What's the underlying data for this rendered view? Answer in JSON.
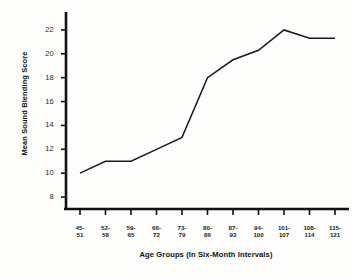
{
  "chart_data": {
    "type": "line",
    "title": "",
    "xlabel": "Age Groups (In Six-Month Intervals)",
    "ylabel": "Mean Sound Blending Score",
    "categories": [
      "45-51",
      "52-58",
      "59-65",
      "66-72",
      "73-79",
      "80-86",
      "87-93",
      "94-100",
      "101-107",
      "108-114",
      "115-121"
    ],
    "category_lines": [
      {
        "top": "45-",
        "bottom": "51"
      },
      {
        "top": "52-",
        "bottom": "58"
      },
      {
        "top": "59-",
        "bottom": "65"
      },
      {
        "top": "66-",
        "bottom": "72"
      },
      {
        "top": "73-",
        "bottom": "79"
      },
      {
        "top": "80-",
        "bottom": "86"
      },
      {
        "top": "87-",
        "bottom": "93"
      },
      {
        "top": "94-",
        "bottom": "100"
      },
      {
        "top": "101-",
        "bottom": "107"
      },
      {
        "top": "108-",
        "bottom": "114"
      },
      {
        "top": "115-",
        "bottom": "121"
      }
    ],
    "values": [
      10.0,
      11.0,
      11.0,
      12.0,
      13.0,
      18.0,
      19.5,
      20.3,
      22.0,
      21.3,
      21.3
    ],
    "ylim": [
      7,
      23
    ],
    "yticks": [
      8,
      10,
      12,
      14,
      16,
      18,
      20,
      22
    ],
    "ytick_labels": [
      "8",
      "10",
      "12",
      "14",
      "16",
      "18",
      "20",
      "22"
    ],
    "grid": false,
    "legend": false,
    "line_color": "#1a1a1a",
    "markers": false
  },
  "style": {
    "background": "#fdfdfc",
    "axis_color": "#111111",
    "text_color": "#1a1a1a"
  }
}
